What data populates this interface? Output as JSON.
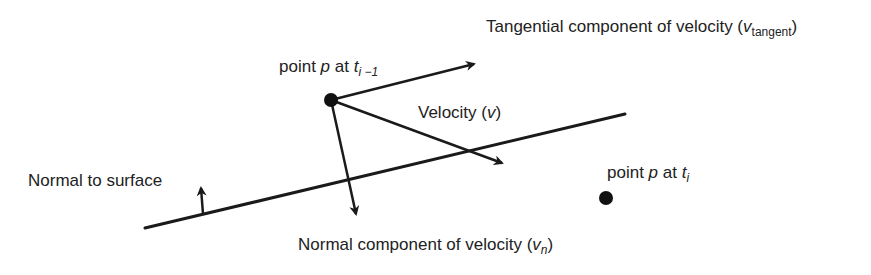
{
  "diagram": {
    "labels": {
      "tangential": {
        "prefix": "Tangential component of velocity (",
        "symbol": "v",
        "subscript": "tangent",
        "suffix": ")"
      },
      "point_prev": {
        "prefix": "point ",
        "symbol": "p",
        "middle": " at ",
        "time": "t",
        "subscript": "i −1"
      },
      "velocity": {
        "prefix": "Velocity (",
        "symbol": "v",
        "suffix": ")"
      },
      "point_curr": {
        "prefix": "point ",
        "symbol": "p",
        "middle": " at ",
        "time": "t",
        "subscript": "i"
      },
      "normal_surface": {
        "text": "Normal to surface"
      },
      "normal_component": {
        "prefix": "Normal component of velocity (",
        "symbol": "v",
        "subscript": "n",
        "suffix": ")"
      }
    },
    "geometry": {
      "surface_line": {
        "x1": 145,
        "y1": 228,
        "x2": 625,
        "y2": 114
      },
      "point_prev": {
        "cx": 331,
        "cy": 100,
        "r": 7
      },
      "point_curr": {
        "cx": 606,
        "cy": 198,
        "r": 7
      },
      "tangential_arrow": {
        "x1": 331,
        "y1": 100,
        "x2": 474,
        "y2": 64
      },
      "velocity_arrow": {
        "x1": 331,
        "y1": 100,
        "x2": 502,
        "y2": 163
      },
      "normal_component_arrow": {
        "x1": 331,
        "y1": 100,
        "x2": 356,
        "y2": 214
      },
      "surface_normal_arrow": {
        "x1": 203,
        "y1": 214,
        "x2": 201,
        "y2": 188
      }
    },
    "colors": {
      "stroke": "#1a1a1a",
      "text": "#222222",
      "background": "#ffffff"
    }
  }
}
